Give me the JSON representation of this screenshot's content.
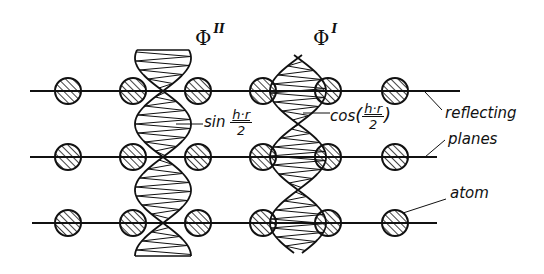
{
  "diagram": {
    "labels": {
      "phi_2": {
        "symbol": "Φ",
        "superscript": "II"
      },
      "phi_1": {
        "symbol": "Φ",
        "superscript": "I"
      },
      "sin_term": {
        "func": "sin",
        "numerator": "h·r",
        "denominator": "2"
      },
      "cos_term": {
        "func": "cos",
        "open": "(",
        "numerator": "h·r",
        "denominator": "2",
        "close": ")"
      },
      "reflecting": "reflecting",
      "planes": "planes",
      "atom": "atom"
    },
    "planes": [
      {
        "y": 91,
        "x1": 30,
        "x2": 460
      },
      {
        "y": 157,
        "x1": 30,
        "x2": 437
      },
      {
        "y": 223,
        "x1": 32,
        "x2": 437
      }
    ],
    "atom_columns_x": [
      68,
      133,
      198,
      263,
      328,
      395
    ],
    "atom_radius": 13,
    "waves": [
      {
        "name": "phi-II",
        "center_x": 163,
        "type": "sin",
        "top": 50,
        "bottom": 256
      },
      {
        "name": "phi-I",
        "center_x": 298,
        "type": "cos",
        "top": 55,
        "bottom": 253
      }
    ]
  }
}
